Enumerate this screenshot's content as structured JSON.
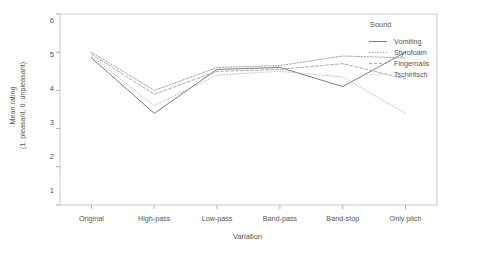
{
  "chart_data": {
    "type": "line",
    "title": "",
    "xlabel": "Variation",
    "ylabel": "Mean rating",
    "ylabel_line2": "(1: pleasant, 6: unpleasant)",
    "categories": [
      "Original",
      "High-pass",
      "Low-pass",
      "Band-pass",
      "Band-stop",
      "Only pitch"
    ],
    "ylim": [
      1,
      6
    ],
    "yticks": [
      1,
      2,
      3,
      4,
      5,
      6
    ],
    "grid": false,
    "legend_position": "right",
    "legend_title": "Sound",
    "series": [
      {
        "name": "Vomiting",
        "values": [
          4.85,
          3.4,
          4.55,
          4.6,
          4.1,
          5.0
        ],
        "color": "#6e6e6e",
        "dash": "none"
      },
      {
        "name": "Styrofoam",
        "values": [
          5.0,
          4.0,
          4.6,
          4.65,
          4.9,
          4.85
        ],
        "color": "#8f8f8f",
        "dash": "dotted"
      },
      {
        "name": "Fingernails",
        "values": [
          4.95,
          3.9,
          4.5,
          4.55,
          4.7,
          4.3
        ],
        "color": "#9c9c9c",
        "dash": "dashed"
      },
      {
        "name": "Tschiritsch",
        "values": [
          4.9,
          3.6,
          4.4,
          4.5,
          4.35,
          3.4
        ],
        "color": "#b4b4b4",
        "dash": "fine-dotted"
      }
    ]
  },
  "axes": {
    "frame_color": "#bcbcbc",
    "tick_color": "#9a9a9a",
    "text_color": "#555555"
  }
}
